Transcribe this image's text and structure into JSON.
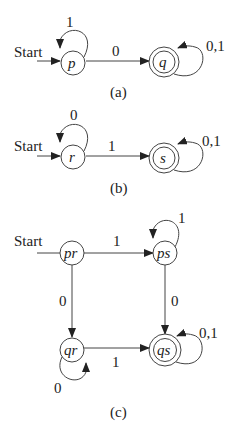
{
  "diagrams": {
    "a": {
      "caption": "(a)",
      "start_label": "Start",
      "states": {
        "p": {
          "label": "p",
          "accepting": false
        },
        "q": {
          "label": "q",
          "accepting": true
        }
      },
      "transitions": {
        "p_self": "1",
        "p_to_q": "0",
        "q_self": "0,1"
      }
    },
    "b": {
      "caption": "(b)",
      "start_label": "Start",
      "states": {
        "r": {
          "label": "r",
          "accepting": false
        },
        "s": {
          "label": "s",
          "accepting": true
        }
      },
      "transitions": {
        "r_self": "0",
        "r_to_s": "1",
        "s_self": "0,1"
      }
    },
    "c": {
      "caption": "(c)",
      "start_label": "Start",
      "states": {
        "pr": {
          "label": "pr",
          "accepting": false
        },
        "ps": {
          "label": "ps",
          "accepting": false
        },
        "qr": {
          "label": "qr",
          "accepting": false
        },
        "qs": {
          "label": "qs",
          "accepting": true
        }
      },
      "transitions": {
        "pr_to_ps": "1",
        "pr_to_qr": "0",
        "ps_self": "1",
        "ps_to_qs": "0",
        "qr_self": "0",
        "qr_to_qs": "1",
        "qs_self": "0,1"
      }
    }
  }
}
